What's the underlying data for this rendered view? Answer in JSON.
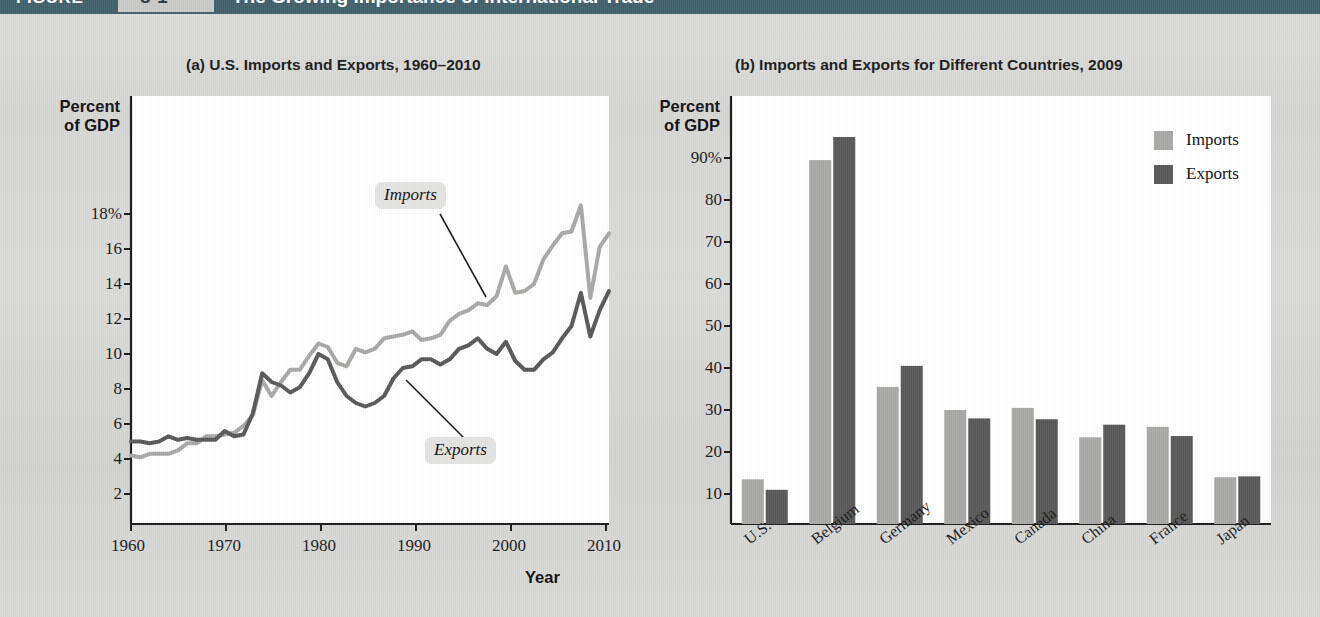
{
  "figure": {
    "label": "FIGURE",
    "number": "8-1",
    "title": "The Growing Importance of International Trade",
    "banner_color": "#41606a"
  },
  "colors": {
    "imports": "#a8a8a6",
    "exports": "#585858",
    "plot_bg": "#ffffff",
    "page_bg": "#d8d8d6",
    "axis": "#1a1a1a"
  },
  "panel_a": {
    "title": "(a) U.S. Imports and Exports, 1960–2010",
    "y_axis_label_line1": "Percent",
    "y_axis_label_line2": "of GDP",
    "x_axis_label": "Year",
    "y_ticks": [
      "18%",
      "16",
      "14",
      "12",
      "10",
      "8",
      "6",
      "4",
      "2"
    ],
    "x_ticks": [
      "1960",
      "1970",
      "1980",
      "1990",
      "2000",
      "2010"
    ],
    "annotations": [
      {
        "name": "imports",
        "text": "Imports"
      },
      {
        "name": "exports",
        "text": "Exports"
      }
    ]
  },
  "panel_b": {
    "title": "(b) Imports and Exports for Different Countries, 2009",
    "y_axis_label_line1": "Percent",
    "y_axis_label_line2": "of GDP",
    "y_ticks": [
      "90%",
      "80",
      "70",
      "60",
      "50",
      "40",
      "30",
      "20",
      "10"
    ],
    "legend": [
      {
        "name": "imports",
        "label": "Imports",
        "color": "#a8a8a6"
      },
      {
        "name": "exports",
        "label": "Exports",
        "color": "#585858"
      }
    ]
  },
  "chart_data": [
    {
      "type": "line",
      "title": "(a) U.S. Imports and Exports, 1960–2010",
      "xlabel": "Year",
      "ylabel": "Percent of GDP",
      "xlim": [
        1960,
        2011
      ],
      "ylim": [
        0,
        19.5
      ],
      "ytick_values": [
        2,
        4,
        6,
        8,
        10,
        12,
        14,
        16,
        18
      ],
      "xtick_values": [
        1960,
        1970,
        1980,
        1990,
        2000,
        2010
      ],
      "grid": false,
      "legend": "annotations on lines",
      "series": [
        {
          "name": "Imports",
          "color": "#a8a8a6",
          "x": [
            1960,
            1961,
            1962,
            1963,
            1964,
            1965,
            1966,
            1967,
            1968,
            1969,
            1970,
            1971,
            1972,
            1973,
            1974,
            1975,
            1976,
            1977,
            1978,
            1979,
            1980,
            1981,
            1982,
            1983,
            1984,
            1985,
            1986,
            1987,
            1988,
            1989,
            1990,
            1991,
            1992,
            1993,
            1994,
            1995,
            1996,
            1997,
            1998,
            1999,
            2000,
            2001,
            2002,
            2003,
            2004,
            2005,
            2006,
            2007,
            2008,
            2009,
            2010,
            2011
          ],
          "values": [
            4.2,
            4.1,
            4.3,
            4.3,
            4.3,
            4.5,
            4.9,
            4.9,
            5.3,
            5.3,
            5.4,
            5.5,
            5.9,
            6.5,
            8.5,
            7.6,
            8.4,
            9.1,
            9.1,
            9.9,
            10.6,
            10.4,
            9.5,
            9.3,
            10.3,
            10.1,
            10.3,
            10.9,
            11.0,
            11.1,
            11.3,
            10.8,
            10.9,
            11.1,
            11.9,
            12.3,
            12.5,
            12.9,
            12.8,
            13.3,
            15.0,
            13.5,
            13.6,
            14.0,
            15.4,
            16.2,
            16.9,
            17.0,
            18.5,
            13.2,
            16.1,
            16.9
          ]
        },
        {
          "name": "Exports",
          "color": "#585858",
          "x": [
            1960,
            1961,
            1962,
            1963,
            1964,
            1965,
            1966,
            1967,
            1968,
            1969,
            1970,
            1971,
            1972,
            1973,
            1974,
            1975,
            1976,
            1977,
            1978,
            1979,
            1980,
            1981,
            1982,
            1983,
            1984,
            1985,
            1986,
            1987,
            1988,
            1989,
            1990,
            1991,
            1992,
            1993,
            1994,
            1995,
            1996,
            1997,
            1998,
            1999,
            2000,
            2001,
            2002,
            2003,
            2004,
            2005,
            2006,
            2007,
            2008,
            2009,
            2010,
            2011
          ],
          "values": [
            5.0,
            5.0,
            4.9,
            5.0,
            5.3,
            5.1,
            5.2,
            5.1,
            5.1,
            5.1,
            5.6,
            5.3,
            5.4,
            6.6,
            8.9,
            8.4,
            8.2,
            7.8,
            8.1,
            8.9,
            10.0,
            9.7,
            8.4,
            7.6,
            7.2,
            7.0,
            7.2,
            7.6,
            8.6,
            9.2,
            9.3,
            9.7,
            9.7,
            9.4,
            9.7,
            10.3,
            10.5,
            10.9,
            10.3,
            10.0,
            10.7,
            9.6,
            9.1,
            9.1,
            9.7,
            10.1,
            10.9,
            11.6,
            13.5,
            11.0,
            12.5,
            13.6
          ]
        }
      ],
      "annotations": [
        {
          "text": "Imports",
          "points_to_year": 2000,
          "points_to_value": 14.0
        },
        {
          "text": "Exports",
          "points_to_year": 1990,
          "points_to_value": 9.3
        }
      ]
    },
    {
      "type": "bar",
      "title": "(b) Imports and Exports for Different Countries, 2009",
      "xlabel": "",
      "ylabel": "Percent of GDP",
      "ylim": [
        0,
        100
      ],
      "ytick_values": [
        10,
        20,
        30,
        40,
        50,
        60,
        70,
        80,
        90
      ],
      "grid": false,
      "legend_position": "top-right",
      "categories": [
        "U.S.",
        "Belgium",
        "Germany",
        "Mexico",
        "Canada",
        "China",
        "France",
        "Japan"
      ],
      "series": [
        {
          "name": "Imports",
          "color": "#a8a8a6",
          "values": [
            13.5,
            89.5,
            35.5,
            30.0,
            30.5,
            23.5,
            26.0,
            14.0
          ]
        },
        {
          "name": "Exports",
          "color": "#585858",
          "values": [
            11.0,
            95.0,
            40.5,
            28.0,
            27.8,
            26.5,
            23.8,
            14.2
          ]
        }
      ]
    }
  ]
}
